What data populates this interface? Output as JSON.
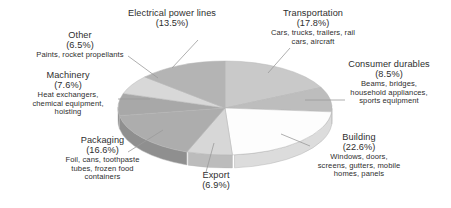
{
  "chart_data": {
    "type": "pie",
    "title": "",
    "subtitle": "",
    "xlabel": "",
    "ylabel": "",
    "legend_position": "callout-labels",
    "grid": false,
    "units": "percent",
    "total": 100.0,
    "categories": [
      "Transportation",
      "Consumer durables",
      "Building",
      "Export",
      "Packaging",
      "Machinery",
      "Other",
      "Electrical power lines"
    ],
    "values": [
      17.8,
      8.5,
      22.6,
      6.9,
      16.6,
      7.6,
      6.5,
      13.5
    ],
    "series": [
      {
        "name": "Share of use",
        "values": [
          17.8,
          8.5,
          22.6,
          6.9,
          16.6,
          7.6,
          6.5,
          13.5
        ]
      }
    ],
    "slices": [
      {
        "name": "Transportation",
        "value": 17.8,
        "pct_label": "(17.8%)",
        "detail": "Cars, trucks, trailers, rail cars, aircraft",
        "color": "#c9c9c9",
        "side_color": "#b0b0b0"
      },
      {
        "name": "Consumer durables",
        "value": 8.5,
        "pct_label": "(8.5%)",
        "detail": "Beams, bridges, household appliances, sports equipment",
        "color": "#bdbdbd",
        "side_color": "#a5a5a5"
      },
      {
        "name": "Building",
        "value": 22.6,
        "pct_label": "(22.6%)",
        "detail": "Windows, doors, screens, gutters, mobile homes, panels",
        "color": "#fdfdfd",
        "side_color": "#dcdcdc"
      },
      {
        "name": "Export",
        "value": 6.9,
        "pct_label": "(6.9%)",
        "detail": "",
        "color": "#d7d7d7",
        "side_color": "#bcbcbc"
      },
      {
        "name": "Packaging",
        "value": 16.6,
        "pct_label": "(16.6%)",
        "detail": "Foil, cans, toothpaste tubes, frozen food containers",
        "color": "#adadad",
        "side_color": "#8f8f8f"
      },
      {
        "name": "Machinery",
        "value": 7.6,
        "pct_label": "(7.6%)",
        "detail": "Heat exchangers, chemical equipment, hoisting",
        "color": "#a8a8a8",
        "side_color": "#8a8a8a"
      },
      {
        "name": "Other",
        "value": 6.5,
        "pct_label": "(6.5%)",
        "detail": "Paints, rocket propellants",
        "color": "#d8d8d8",
        "side_color": "#bbbbbb"
      },
      {
        "name": "Electrical power lines",
        "value": 13.5,
        "pct_label": "(13.5%)",
        "detail": "",
        "color": "#b4b4b4",
        "side_color": "#989898"
      }
    ],
    "geometry": {
      "center_x": 225,
      "center_y": 108,
      "radius_x": 107,
      "radius_y": 47,
      "depth": 13,
      "start_angle_deg": -90,
      "direction": "clockwise"
    },
    "colors": {
      "background": "#ffffff",
      "text": "#2e2e2e",
      "leader_line": "#9a9a9a",
      "slice_outline": "#b5b5b5"
    }
  },
  "labels": {
    "transportation": {
      "title": "Transportation",
      "pct": "(17.8%)",
      "detail_lines": [
        "Cars, trucks, trailers, rail",
        "cars, aircraft"
      ]
    },
    "consumer_durables": {
      "title": "Consumer durables",
      "pct": "(8.5%)",
      "detail_lines": [
        "Beams, bridges,",
        "household appliances,",
        "sports equipment"
      ]
    },
    "building": {
      "title": "Building",
      "pct": "(22.6%)",
      "detail_lines": [
        "Windows, doors,",
        "screens, gutters, mobile",
        "homes, panels"
      ]
    },
    "export": {
      "title": "Export",
      "pct": "(6.9%)",
      "detail_lines": []
    },
    "packaging": {
      "title": "Packaging",
      "pct": "(16.6%)",
      "detail_lines": [
        "Foil, cans, toothpaste",
        "tubes, frozen food",
        "containers"
      ]
    },
    "machinery": {
      "title": "Machinery",
      "pct": "(7.6%)",
      "detail_lines": [
        "Heat exchangers,",
        "chemical equipment,",
        "hoisting"
      ]
    },
    "other": {
      "title": "Other",
      "pct": "(6.5%)",
      "detail_lines": [
        "Paints, rocket propellants"
      ]
    },
    "electrical_power_lines": {
      "title": "Electrical power lines",
      "pct": "(13.5%)",
      "detail_lines": []
    }
  }
}
